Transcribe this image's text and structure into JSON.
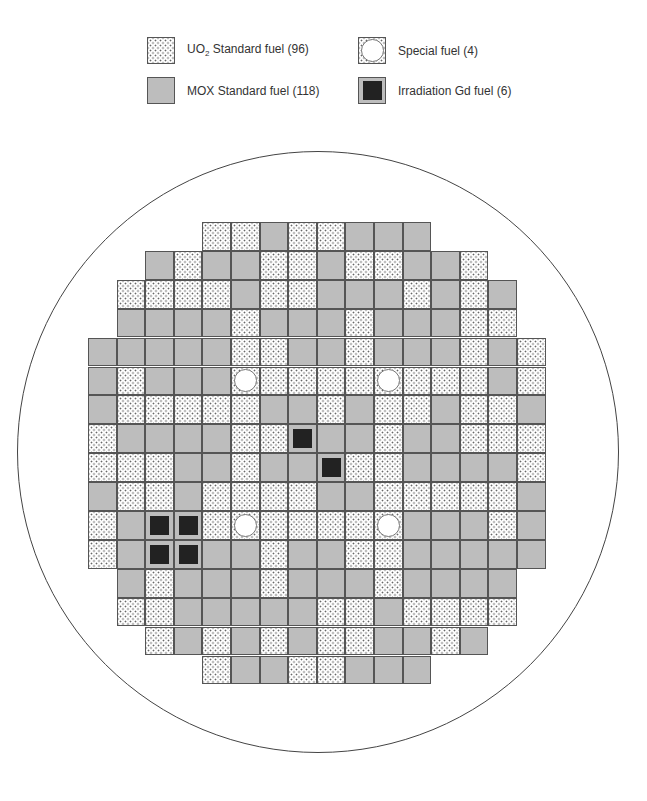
{
  "legend": {
    "items": [
      {
        "key": "u",
        "label_main": "UO",
        "label_sub": "2",
        "label_rest": " Standard fuel (96)",
        "x": 147,
        "y": 37
      },
      {
        "key": "m",
        "label_main": "MOX Standard fuel (118)",
        "label_sub": "",
        "label_rest": "",
        "x": 147,
        "y": 77
      },
      {
        "key": "s",
        "label_main": "Special fuel (4)",
        "label_sub": "",
        "label_rest": "",
        "x": 358,
        "y": 37
      },
      {
        "key": "g",
        "label_main": "Irradiation Gd fuel (6)",
        "label_sub": "",
        "label_rest": "",
        "x": 358,
        "y": 77
      }
    ]
  },
  "colors": {
    "mox": "#bdbdbd",
    "uo2_bg": "#ffffff",
    "dot": "#666666",
    "gd_core": "#222222",
    "grid_line": "#555555",
    "circle": "#444444"
  },
  "core": {
    "circle": {
      "cx": 318,
      "cy": 452,
      "r": 301
    },
    "grid_origin": {
      "x": 88,
      "y": 222
    },
    "cell_size": {
      "w": 28.6,
      "h": 28.9
    },
    "legend_codes": {
      "U": "UO2 Standard fuel",
      "M": "MOX Standard fuel",
      "S": "Special fuel",
      "G": "Irradiation Gd fuel"
    },
    "rows": [
      {
        "start": 4,
        "cells": "UUMUUMMM"
      },
      {
        "start": 2,
        "cells": "MUMMUUMUUMMU"
      },
      {
        "start": 1,
        "cells": "UUUUMUUMMMUMUM"
      },
      {
        "start": 1,
        "cells": "MMMMUMMMUMMMUU"
      },
      {
        "start": 0,
        "cells": "MMMMMUUMMUMMMUMU"
      },
      {
        "start": 0,
        "cells": "MUMMMSUUUUSUUUMU"
      },
      {
        "start": 0,
        "cells": "MUUUUUMMUMUUMUUM"
      },
      {
        "start": 0,
        "cells": "UMMMMUUGMMUMMUUU"
      },
      {
        "start": 0,
        "cells": "UUUMMUMMGUUMMMMU"
      },
      {
        "start": 0,
        "cells": "MUUMUUUUMMUUUUUM"
      },
      {
        "start": 0,
        "cells": "UMGGUSUUUUSMMMUM"
      },
      {
        "start": 0,
        "cells": "UMGGMMUMMUUMMMMM"
      },
      {
        "start": 1,
        "cells": "MUMMMUMMMUMMMM"
      },
      {
        "start": 1,
        "cells": "UUMMMMMUUMUUUU"
      },
      {
        "start": 2,
        "cells": "UMUMUMUUMMUM"
      },
      {
        "start": 4,
        "cells": "UMMUUMMM"
      }
    ]
  }
}
